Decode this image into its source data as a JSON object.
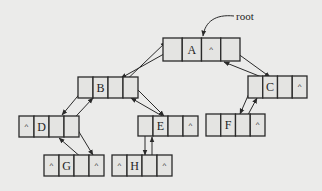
{
  "diagram": {
    "type": "threaded-binary-tree-linked-list",
    "root_label": "root",
    "null_symbol": "^",
    "colors": {
      "background": "#ebebea",
      "line": "#2a2a2a",
      "cell": "#e4e4e2"
    },
    "nodes": [
      {
        "id": "A",
        "label": "A",
        "x": 163,
        "y": 38,
        "w": 77,
        "h": 23,
        "cells": [
          "",
          "A",
          "^",
          ""
        ]
      },
      {
        "id": "B",
        "label": "B",
        "x": 78,
        "y": 77,
        "w": 60,
        "h": 21,
        "cells": [
          "",
          "B",
          "",
          ""
        ]
      },
      {
        "id": "C",
        "label": "C",
        "x": 248,
        "y": 76,
        "w": 59,
        "h": 22,
        "cells": [
          "",
          "C",
          "",
          "^"
        ]
      },
      {
        "id": "D",
        "label": "D",
        "x": 19,
        "y": 116,
        "w": 60,
        "h": 21,
        "cells": [
          "^",
          "D",
          "",
          ""
        ]
      },
      {
        "id": "E",
        "label": "E",
        "x": 138,
        "y": 116,
        "w": 60,
        "h": 20,
        "cells": [
          "",
          "E",
          "",
          "^"
        ]
      },
      {
        "id": "F",
        "label": "F",
        "x": 206,
        "y": 114,
        "w": 59,
        "h": 22,
        "cells": [
          "",
          "F",
          "",
          "^"
        ]
      },
      {
        "id": "G",
        "label": "G",
        "x": 44,
        "y": 155,
        "w": 60,
        "h": 21,
        "cells": [
          "^",
          "G",
          "",
          "^"
        ]
      },
      {
        "id": "H",
        "label": "H",
        "x": 112,
        "y": 155,
        "w": 60,
        "h": 21,
        "cells": [
          "^",
          "H",
          "",
          "^"
        ]
      }
    ],
    "edges": [
      {
        "from": "root",
        "to": "A",
        "kind": "root-pointer"
      },
      {
        "from": "A",
        "to": "B",
        "kind": "child"
      },
      {
        "from": "B",
        "to": "A",
        "kind": "parent"
      },
      {
        "from": "A",
        "to": "C",
        "kind": "child"
      },
      {
        "from": "C",
        "to": "A",
        "kind": "parent"
      },
      {
        "from": "B",
        "to": "D",
        "kind": "child"
      },
      {
        "from": "D",
        "to": "B",
        "kind": "parent"
      },
      {
        "from": "B",
        "to": "E",
        "kind": "child"
      },
      {
        "from": "E",
        "to": "B",
        "kind": "parent"
      },
      {
        "from": "C",
        "to": "F",
        "kind": "child"
      },
      {
        "from": "F",
        "to": "C",
        "kind": "parent"
      },
      {
        "from": "D",
        "to": "G",
        "kind": "child"
      },
      {
        "from": "G",
        "to": "D",
        "kind": "parent"
      },
      {
        "from": "E",
        "to": "H",
        "kind": "child"
      },
      {
        "from": "H",
        "to": "E",
        "kind": "parent"
      }
    ]
  }
}
